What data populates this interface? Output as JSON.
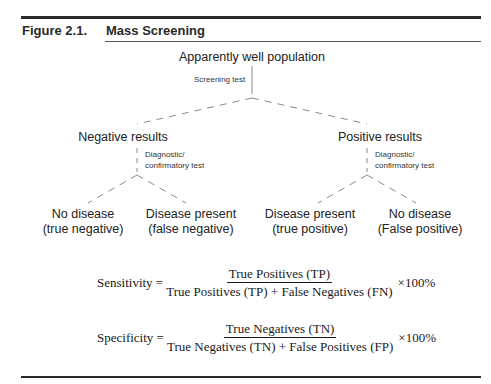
{
  "figure": {
    "label": "Figure 2.1.",
    "title": "Mass Screening"
  },
  "diagram": {
    "root": "Apparently well population",
    "root_edge_label": "Screening test",
    "branches": [
      {
        "label": "Negative results",
        "edge_label_line1": "Diagnostic/",
        "edge_label_line2": "confirmatory test",
        "leaves": [
          {
            "line1": "No disease",
            "line2": "(true negative)"
          },
          {
            "line1": "Disease present",
            "line2": "(false negative)"
          }
        ]
      },
      {
        "label": "Positive results",
        "edge_label_line1": "Diagnostic/",
        "edge_label_line2": "confirmatory test",
        "leaves": [
          {
            "line1": "Disease present",
            "line2": "(true positive)"
          },
          {
            "line1": "No disease",
            "line2": "(False positive)"
          }
        ]
      }
    ]
  },
  "formulas": {
    "sensitivity": {
      "lhs": "Sensitivity =",
      "numerator": "True Positives (TP)",
      "denominator": "True Positives (TP) + False Negatives (FN)",
      "multiplier": "×100%"
    },
    "specificity": {
      "lhs": "Specificity =",
      "numerator": "True Negatives (TN)",
      "denominator": "True Negatives (TN) + False Positives (FP)",
      "multiplier": "×100%"
    }
  }
}
